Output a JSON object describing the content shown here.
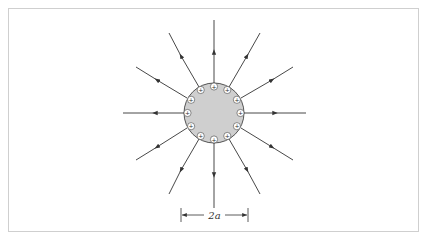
{
  "diagram": {
    "center": {
      "x": 214,
      "y": 113
    },
    "radius": 30,
    "charge_symbol": "+",
    "charge_count": 14,
    "field_line_count": 14,
    "field_direction": "outward",
    "dimension_label": "2a",
    "colors": {
      "fill": "#cfcfcf",
      "line": "#333333",
      "frame": "#cfcfcf"
    }
  }
}
